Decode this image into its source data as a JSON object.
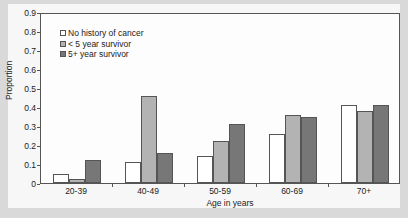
{
  "chart_data": {
    "type": "bar",
    "title": "",
    "xlabel": "Age in years",
    "ylabel": "Proportion",
    "ylim": [
      0,
      0.9
    ],
    "yticks": [
      "0",
      "0.1",
      "0.2",
      "0.3",
      "0.4",
      "0.5",
      "0.6",
      "0.7",
      "0.8",
      "0.9"
    ],
    "categories": [
      "20-39",
      "40-49",
      "50-59",
      "60-69",
      "70+"
    ],
    "series": [
      {
        "name": "No history of cancer",
        "color": "#ffffff",
        "values": [
          0.05,
          0.11,
          0.14,
          0.26,
          0.41
        ]
      },
      {
        "name": "< 5 year survivor",
        "color": "#b3b3b3",
        "values": [
          0.02,
          0.46,
          0.22,
          0.36,
          0.38
        ]
      },
      {
        "name": "5+ year survivor",
        "color": "#777777",
        "values": [
          0.12,
          0.16,
          0.31,
          0.35,
          0.41
        ]
      }
    ],
    "legend_position": "upper-left",
    "grid": false
  }
}
